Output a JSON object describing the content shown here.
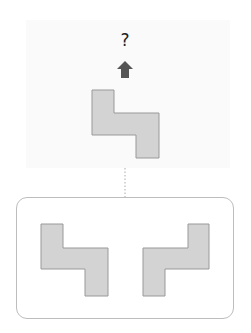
{
  "question": {
    "label": "?"
  },
  "arrow": {
    "direction": "up",
    "icon": "up-arrow-icon",
    "color": "#555555"
  },
  "shape_fill": "#d3d3d3",
  "shape_stroke": "#999999",
  "target_shape": {
    "name": "z-tetromino-shape",
    "description": "S/Z shaped piece"
  },
  "options": [
    {
      "name": "option-left",
      "description": "Z shape, same orientation as target"
    },
    {
      "name": "option-right",
      "description": "mirrored S shape"
    }
  ]
}
